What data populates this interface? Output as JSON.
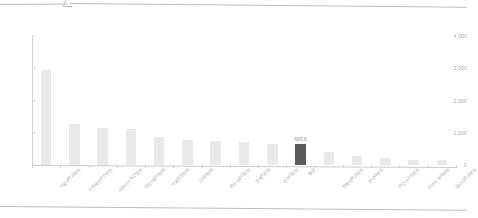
{
  "page": {
    "background": "#ffffff",
    "divider_color": "#b9bcc0"
  },
  "chart_data": {
    "type": "bar",
    "title": "",
    "subtitle": "",
    "xlabel": "",
    "ylabel": "",
    "ylim": [
      0,
      4000
    ],
    "ytick_labels": [
      "0",
      "1,000",
      "2,000",
      "3,000",
      "4,000"
    ],
    "ytick_values": [
      0,
      1000,
      2000,
      3000,
      4000
    ],
    "grid": false,
    "legend": null,
    "bar_color": "#e9e9e9",
    "highlight_color": "#5a5a5a",
    "highlight_index": 9,
    "categories": [
      "서울대학교병원",
      "신촌세브란스병원",
      "서울아산 재단병원",
      "삼성서울대병원",
      "서울성모병원",
      "고려대병원",
      "분당서울대병원",
      "연세의료원",
      "아주대병원",
      "평균",
      "경희대학교병원",
      "영남대병원",
      "한양대구리병원",
      "인하대 부속병원",
      "울산대학교병원"
    ],
    "values": [
      2960,
      1280,
      1160,
      1110,
      860,
      780,
      760,
      710,
      640,
      665.8,
      410,
      280,
      210,
      160,
      150
    ],
    "data_labels": [
      "",
      "",
      "",
      "",
      "",
      "",
      "",
      "",
      "",
      "665.8",
      "",
      "",
      "",
      "",
      ""
    ]
  }
}
